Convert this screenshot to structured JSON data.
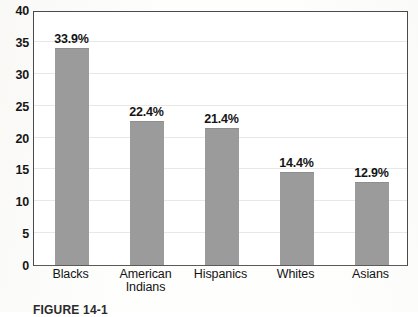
{
  "chart_data": {
    "type": "bar",
    "title": "",
    "xlabel": "",
    "ylabel": "",
    "categories": [
      "Blacks",
      "American Indians",
      "Hispanics",
      "Whites",
      "Asians"
    ],
    "category_lines": [
      [
        "Blacks"
      ],
      [
        "American",
        "Indians"
      ],
      [
        "Hispanics"
      ],
      [
        "Whites"
      ],
      [
        "Asians"
      ]
    ],
    "values": [
      33.9,
      22.4,
      21.4,
      14.4,
      12.9
    ],
    "data_labels": [
      "33.9%",
      "22.4%",
      "21.4%",
      "14.4%",
      "12.9%"
    ],
    "ylim": [
      0,
      40
    ],
    "ytick_values": [
      0,
      5,
      10,
      15,
      20,
      25,
      30,
      35,
      40
    ],
    "ytick_labels": [
      "0",
      "5",
      "10",
      "15",
      "20",
      "25",
      "30",
      "35",
      "40"
    ],
    "grid": true,
    "legend": "none",
    "bar_color": "#9b9b9b",
    "grid_color": "#e8e8e6",
    "axis_color": "#4a4a4a",
    "text_color": "#141414",
    "background": "#ffffff"
  },
  "caption": {
    "text": "FIGURE 14-1"
  }
}
